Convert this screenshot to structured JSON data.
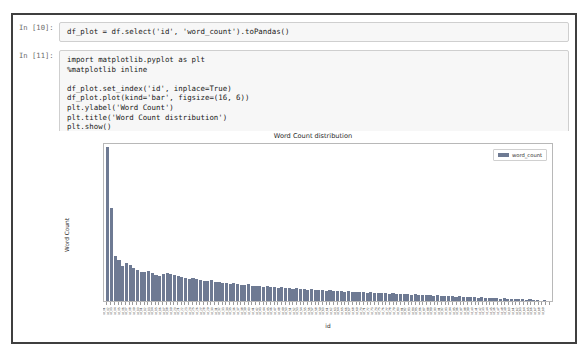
{
  "notebook": {
    "cells": [
      {
        "prompt": "In [10]:",
        "lines": [
          "df_plot = df.select('id', 'word_count').toPandas()"
        ]
      },
      {
        "prompt": "In [11]:",
        "lines": [
          "import matplotlib.pyplot as plt",
          "%matplotlib inline",
          "",
          "df_plot.set_index('id', inplace=True)",
          "df_plot.plot(kind='bar', figsize=(16, 6))",
          "plt.ylabel('Word Count')",
          "plt.title('Word Count distribution')",
          "plt.show()"
        ]
      }
    ]
  },
  "chart_data": {
    "type": "bar",
    "title": "Word Count distribution",
    "xlabel": "id",
    "ylabel": "Word Count",
    "ylim": [
      0,
      310
    ],
    "yticks": [
      0,
      50,
      100,
      150,
      200,
      250,
      300
    ],
    "grid": false,
    "legend_position": "upper right",
    "bar_color": "#6e7a93",
    "series": [
      {
        "name": "word_count",
        "values": [
          305,
          183,
          88,
          80,
          70,
          75,
          72,
          66,
          62,
          58,
          57,
          60,
          55,
          52,
          50,
          53,
          56,
          54,
          51,
          49,
          48,
          46,
          44,
          45,
          43,
          42,
          40,
          39,
          41,
          38,
          37,
          36,
          35,
          34,
          36,
          33,
          32,
          31,
          33,
          30,
          29,
          30,
          28,
          29,
          27,
          28,
          26,
          27,
          25,
          26,
          24,
          25,
          23,
          24,
          22,
          23,
          22,
          21,
          22,
          20,
          21,
          20,
          19,
          20,
          18,
          19,
          18,
          17,
          18,
          17,
          16,
          17,
          16,
          15,
          16,
          15,
          14,
          15,
          14,
          13,
          14,
          13,
          12,
          13,
          12,
          11,
          12,
          11,
          10,
          11,
          10,
          9,
          10,
          9,
          8,
          9,
          8,
          7,
          8,
          7,
          6,
          7,
          6,
          5,
          6,
          5,
          4,
          5,
          4,
          3,
          4,
          3,
          3,
          2,
          3,
          2,
          2,
          1,
          2,
          1
        ]
      }
    ],
    "categories": [
      "id_00",
      "id_01",
      "id_02",
      "id_03",
      "id_04",
      "id_05",
      "id_06",
      "id_07",
      "id_08",
      "id_09",
      "id_10",
      "id_11",
      "id_12",
      "id_13",
      "id_14",
      "id_15",
      "id_16",
      "id_17",
      "id_18",
      "id_19",
      "id_20",
      "id_21",
      "id_22",
      "id_23",
      "id_24",
      "id_25",
      "id_26",
      "id_27",
      "id_28",
      "id_29",
      "id_30",
      "id_31",
      "id_32",
      "id_33",
      "id_34",
      "id_35",
      "id_36",
      "id_37",
      "id_38",
      "id_39",
      "id_40",
      "id_41",
      "id_42",
      "id_43",
      "id_44",
      "id_45",
      "id_46",
      "id_47",
      "id_48",
      "id_49",
      "id_50",
      "id_51",
      "id_52",
      "id_53",
      "id_54",
      "id_55",
      "id_56",
      "id_57",
      "id_58",
      "id_59",
      "id_60",
      "id_61",
      "id_62",
      "id_63",
      "id_64",
      "id_65",
      "id_66",
      "id_67",
      "id_68",
      "id_69",
      "id_70",
      "id_71",
      "id_72",
      "id_73",
      "id_74",
      "id_75",
      "id_76",
      "id_77",
      "id_78",
      "id_79",
      "id_80",
      "id_81",
      "id_82",
      "id_83",
      "id_84",
      "id_85",
      "id_86",
      "id_87",
      "id_88",
      "id_89",
      "id_90",
      "id_91",
      "id_92",
      "id_93",
      "id_94",
      "id_95",
      "id_96",
      "id_97",
      "id_98",
      "id_99",
      "id_a0",
      "id_a1",
      "id_a2",
      "id_a3",
      "id_a4",
      "id_a5",
      "id_a6",
      "id_a7",
      "id_a8",
      "id_a9",
      "id_b0",
      "id_b1",
      "id_b2",
      "id_b3",
      "id_b4",
      "id_b5",
      "id_b6",
      "id_b7",
      "id_b8",
      "id_b9"
    ]
  }
}
